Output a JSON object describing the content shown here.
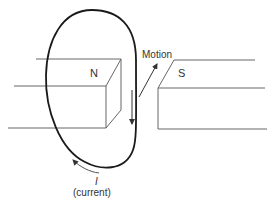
{
  "diagram": {
    "magnets": {
      "north": {
        "label": "N"
      },
      "south": {
        "label": "S"
      }
    },
    "labels": {
      "motion": "Motion",
      "current_symbol": "I",
      "current_text": "(current)"
    },
    "colors": {
      "line": "#555555",
      "loop": "#1a1a1a",
      "text": "#333333",
      "background": "#ffffff"
    }
  }
}
